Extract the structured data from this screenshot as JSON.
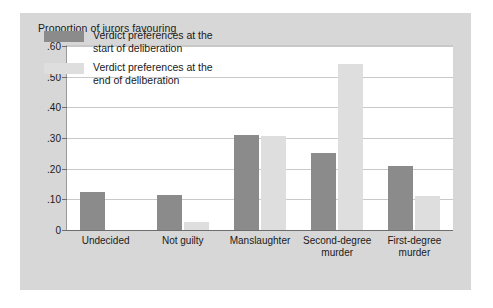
{
  "chart_data": {
    "type": "bar",
    "title": "Proportion of jurors favouring",
    "xlabel": "",
    "ylabel": "",
    "ylim": [
      0,
      0.6
    ],
    "grid": true,
    "legend_position": "inside-top-left",
    "categories": [
      "Undecided",
      "Not guilty",
      "Manslaughter",
      "Second-degree\nmurder",
      "First-degree\nmurder"
    ],
    "ytick_labels": [
      "0",
      ".10",
      ".20",
      ".30",
      ".40",
      ".50",
      ".60"
    ],
    "ytick_values": [
      0,
      0.1,
      0.2,
      0.3,
      0.4,
      0.5,
      0.6
    ],
    "series": [
      {
        "name": "Verdict preferences at the\nstart of deliberation",
        "color": "#8b8b8b",
        "values": [
          0.125,
          0.115,
          0.31,
          0.25,
          0.21
        ]
      },
      {
        "name": "Verdict preferences at the\nend of deliberation",
        "color": "#dedede",
        "values": [
          0.0,
          0.025,
          0.305,
          0.54,
          0.11
        ]
      }
    ]
  },
  "panel": {
    "background_color": "#d7d7d7",
    "plot_background_color": "#ffffff",
    "gridline_color": "#c9c9c9",
    "axis_color": "#6e6e6e"
  }
}
